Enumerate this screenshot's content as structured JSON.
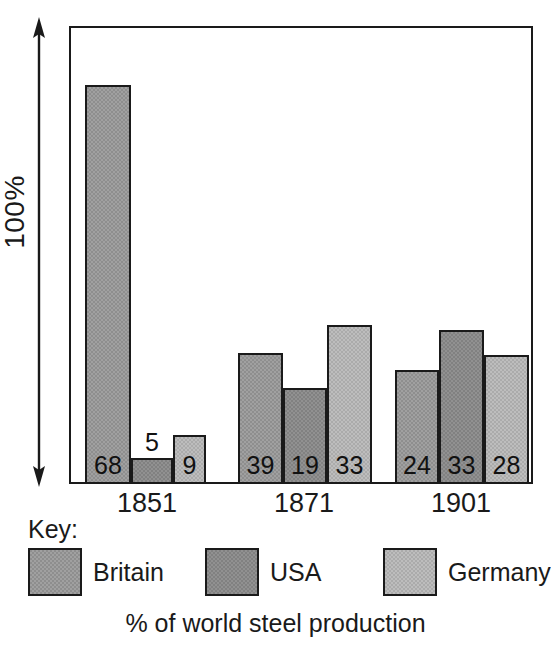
{
  "chart_data": {
    "type": "bar",
    "title": "",
    "caption": "% of world steel production",
    "xlabel": "",
    "ylabel": "100%",
    "ylim": [
      0,
      100
    ],
    "grid": false,
    "legend_position": "bottom",
    "categories": [
      "1851",
      "1871",
      "1901"
    ],
    "series": [
      {
        "name": "Britain",
        "color": "#8e8e8e",
        "values": [
          68,
          39,
          24
        ]
      },
      {
        "name": "USA",
        "color": "#818181",
        "values": [
          5,
          19,
          33
        ]
      },
      {
        "name": "Germany",
        "color": "#ababab",
        "values": [
          9,
          33,
          28
        ]
      }
    ],
    "bars": [
      {
        "group": "1851",
        "series": "Britain",
        "value": 68,
        "label": "68",
        "label_inside": true,
        "x": 16,
        "width": 46,
        "height": 399,
        "fill": "fill-britain"
      },
      {
        "group": "1851",
        "series": "USA",
        "value": 5,
        "label": "5",
        "label_inside": false,
        "x": 62,
        "width": 42,
        "height": 26,
        "fill": "fill-usa"
      },
      {
        "group": "1851",
        "series": "Germany",
        "value": 9,
        "label": "9",
        "label_inside": true,
        "x": 104,
        "width": 33,
        "height": 49,
        "fill": "fill-germany"
      },
      {
        "group": "1871",
        "series": "Britain",
        "value": 39,
        "label": "39",
        "label_inside": true,
        "x": 169,
        "width": 45,
        "height": 131,
        "fill": "fill-britain"
      },
      {
        "group": "1871",
        "series": "USA",
        "value": 19,
        "label": "19",
        "label_inside": true,
        "x": 214,
        "width": 44,
        "height": 96,
        "fill": "fill-usa"
      },
      {
        "group": "1871",
        "series": "Germany",
        "value": 33,
        "label": "33",
        "label_inside": true,
        "x": 258,
        "width": 45,
        "height": 159,
        "fill": "fill-germany"
      },
      {
        "group": "1901",
        "series": "Britain",
        "value": 24,
        "label": "24",
        "label_inside": true,
        "x": 326,
        "width": 44,
        "height": 114,
        "fill": "fill-britain"
      },
      {
        "group": "1901",
        "series": "USA",
        "value": 33,
        "label": "33",
        "label_inside": true,
        "x": 370,
        "width": 45,
        "height": 154,
        "fill": "fill-usa"
      },
      {
        "group": "1901",
        "series": "Germany",
        "value": 28,
        "label": "28",
        "label_inside": true,
        "x": 415,
        "width": 45,
        "height": 129,
        "fill": "fill-germany"
      }
    ],
    "group_label_x": [
      {
        "label": "1851",
        "left": 8,
        "width": 140
      },
      {
        "label": "1871",
        "left": 165,
        "width": 140
      },
      {
        "label": "1901",
        "left": 322,
        "width": 140
      }
    ]
  },
  "axis": {
    "scale_label": "100%",
    "arrow": "double-headed-vertical-arrow"
  },
  "key": {
    "title": "Key:",
    "items": [
      {
        "label": "Britain",
        "fill": "fill-britain",
        "left": 0
      },
      {
        "label": "USA",
        "fill": "fill-usa",
        "left": 177
      },
      {
        "label": "Germany",
        "fill": "fill-germany",
        "left": 355
      }
    ]
  },
  "caption": "% of world steel production"
}
